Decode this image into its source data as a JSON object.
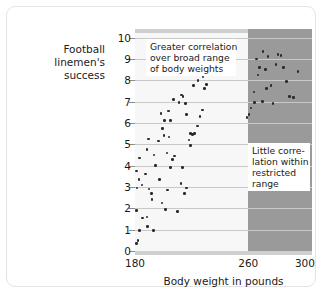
{
  "chart_data": {
    "type": "scatter",
    "title": "",
    "xlabel": "Body weight in pounds",
    "ylabel": "Football linemen's success",
    "ylabel_lines": [
      "Football linemen's",
      "success"
    ],
    "xlim": [
      180,
      305
    ],
    "ylim": [
      0,
      10.4
    ],
    "xticks": [
      180,
      260,
      300
    ],
    "yticks": [
      0,
      1,
      2,
      3,
      4,
      5,
      6,
      7,
      8,
      9,
      10
    ],
    "grid": "horizontal",
    "legend": "none",
    "regions": [
      {
        "name": "broad-range",
        "x_from": 180,
        "x_to": 260,
        "color": "#f7f7f7"
      },
      {
        "name": "restricted-range",
        "x_from": 260,
        "x_to": 305,
        "color": "#9a9a9a"
      }
    ],
    "annotations": [
      {
        "name": "broad-range-note",
        "lines": [
          "Greater correlation",
          "over broad range",
          "of body weights"
        ]
      },
      {
        "name": "restricted-range-note",
        "lines": [
          "Little corre-",
          "lation within",
          "restricted",
          "range"
        ]
      }
    ],
    "points": [
      [
        181.0,
        0.35
      ],
      [
        182.2,
        0.5
      ],
      [
        181.0,
        1.9
      ],
      [
        183.0,
        0.95
      ],
      [
        185.5,
        1.55
      ],
      [
        188.5,
        1.6
      ],
      [
        189.0,
        1.15
      ],
      [
        193.0,
        0.95
      ],
      [
        181.5,
        2.95
      ],
      [
        182.8,
        3.35
      ],
      [
        181.2,
        3.75
      ],
      [
        183.0,
        4.35
      ],
      [
        185.0,
        3.1
      ],
      [
        187.5,
        3.6
      ],
      [
        188.5,
        4.75
      ],
      [
        189.5,
        5.25
      ],
      [
        190.0,
        2.9
      ],
      [
        191.5,
        2.7
      ],
      [
        192.0,
        2.4
      ],
      [
        193.5,
        4.5
      ],
      [
        194.5,
        4.0
      ],
      [
        196.5,
        5.15
      ],
      [
        197.5,
        3.35
      ],
      [
        199.0,
        2.25
      ],
      [
        201.5,
        1.95
      ],
      [
        203.0,
        2.85
      ],
      [
        205.0,
        3.9
      ],
      [
        206.5,
        4.3
      ],
      [
        208.0,
        4.45
      ],
      [
        210.0,
        1.85
      ],
      [
        212.5,
        3.15
      ],
      [
        213.5,
        3.9
      ],
      [
        215.0,
        2.7
      ],
      [
        216.5,
        2.95
      ],
      [
        218.0,
        5.2
      ],
      [
        219.0,
        4.95
      ],
      [
        220.5,
        5.45
      ],
      [
        222.0,
        5.5
      ],
      [
        200.5,
        5.4
      ],
      [
        202.5,
        4.6
      ],
      [
        204.0,
        5.35
      ],
      [
        199.5,
        5.75
      ],
      [
        201.0,
        6.1
      ],
      [
        198.5,
        6.45
      ],
      [
        203.5,
        6.55
      ],
      [
        205.0,
        6.1
      ],
      [
        207.0,
        7.1
      ],
      [
        211.0,
        6.95
      ],
      [
        213.0,
        7.3
      ],
      [
        214.0,
        7.25
      ],
      [
        215.5,
        6.9
      ],
      [
        216.5,
        6.4
      ],
      [
        219.0,
        5.5
      ],
      [
        224.0,
        5.85
      ],
      [
        226.0,
        6.3
      ],
      [
        227.5,
        6.6
      ],
      [
        229.0,
        7.6
      ],
      [
        230.5,
        7.8
      ],
      [
        228.0,
        8.15
      ],
      [
        224.5,
        8.0
      ],
      [
        221.5,
        7.75
      ],
      [
        259.0,
        6.25
      ],
      [
        260.5,
        6.4
      ],
      [
        262.0,
        6.7
      ],
      [
        264.0,
        7.45
      ],
      [
        266.0,
        9.0
      ],
      [
        268.0,
        8.6
      ],
      [
        270.5,
        9.35
      ],
      [
        272.0,
        8.5
      ],
      [
        274.0,
        9.1
      ],
      [
        276.0,
        7.75
      ],
      [
        277.5,
        6.9
      ],
      [
        279.5,
        8.75
      ],
      [
        281.0,
        9.2
      ],
      [
        283.0,
        9.15
      ],
      [
        285.0,
        8.6
      ],
      [
        287.0,
        7.95
      ],
      [
        289.0,
        7.25
      ],
      [
        292.0,
        7.2
      ],
      [
        295.0,
        8.4
      ],
      [
        264.5,
        6.95
      ],
      [
        270.0,
        7.0
      ],
      [
        273.0,
        7.6
      ],
      [
        267.0,
        8.25
      ]
    ]
  }
}
